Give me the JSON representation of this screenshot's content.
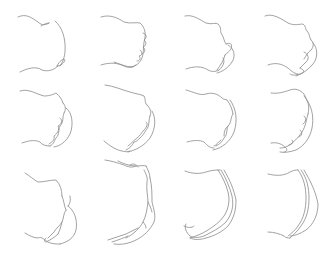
{
  "figure": {
    "width": 333,
    "height": 254,
    "background": "#ffffff",
    "stroke_color": "#8a8a8a",
    "stroke_width": 0.8,
    "layout": {
      "rows": 3,
      "cols": 4
    }
  },
  "panels": [
    {
      "id": "r1c1",
      "paths": [
        "M18,17 C26,13 32,18 38,22 C42,26 46,25 49,23",
        "M41,26 C44,24 47,23 49,23",
        "M55,21 C62,27 66,38 65,52 C64,60 62,63 60,66",
        "M20,72 C28,68 36,66 42,70 C48,72 54,70 58,66",
        "M57,66 C60,60 64,58 65,60 C64,63 61,66 57,66"
      ]
    },
    {
      "id": "r1c2",
      "paths": [
        "M101,17 C110,14 118,18 124,22 C130,24 136,22 140,23 C146,28 146,36 144,42 C143,48 144,55 141,60 C139,64 135,66 132,67",
        "M143,33 C147,34 147,38 144,40 C147,42 146,46 143,47 C146,49 145,53 142,54",
        "M140,50 C143,52 142,56 139,56 C141,58 140,61 137,61",
        "M101,65 C110,62 118,63 124,66 C128,68 132,68 136,65",
        "M114,62 C120,64 126,67 132,67"
      ]
    },
    {
      "id": "r1c3",
      "paths": [
        "M185,16 C193,14 200,20 206,23 C212,25 216,22 218,24 C222,28 220,31 221,33 C224,37 224,42 226,44",
        "M226,44 C230,42 233,44 231,49 C229,52 227,53 225,55",
        "M228,45 C234,48 236,56 232,62 C228,68 222,72 217,73",
        "M225,55 C224,60 220,66 217,70",
        "M223,58 C226,62 222,68 218,71",
        "M186,69 C194,66 202,66 208,70 C212,72 216,72 218,70"
      ]
    },
    {
      "id": "r1c4",
      "paths": [
        "M265,16 C272,13 280,18 288,23 C294,26 300,24 303,24 C306,26 305,29 307,31 C310,34 309,37 311,40",
        "M311,40 C314,42 314,47 311,50 C308,52 306,56 304,59",
        "M313,43 C318,48 318,58 313,64 C308,70 302,74 296,76",
        "M304,52 C308,54 310,58 306,62 C304,64 302,66 300,68",
        "M300,68 C304,70 306,72 300,74 C296,75 292,76 290,74",
        "M268,65 C276,62 282,64 288,68 C292,72 296,74 298,74"
      ]
    },
    {
      "id": "r2c1",
      "paths": [
        "M20,91 C28,88 36,94 44,96 C50,96 54,94 56,93 C60,96 62,100 63,103",
        "M63,103 C66,106 66,110 64,113",
        "M66,108 C72,112 74,124 70,134 C66,142 60,146 54,147",
        "M64,113 C62,118 64,122 60,126 C58,130 60,134 56,138 C54,141 54,144 50,146",
        "M60,118 C63,120 62,124 58,126 C60,130 57,134 54,136 C55,140 52,142 49,144",
        "M22,143 C30,140 36,140 40,142 C42,145 46,146 50,146"
      ]
    },
    {
      "id": "r2c2",
      "paths": [
        "M105,85 C114,86 122,90 130,92 C136,94 140,94 144,96 C146,99 144,102 147,105",
        "M147,105 C150,108 152,112 150,116",
        "M152,111 C156,118 156,128 150,138 C144,146 136,150 128,152",
        "M150,116 C148,122 150,126 146,130 C144,134 142,136 140,138 C138,140 136,142 134,142 C132,146 130,148 126,150",
        "M146,122 C149,124 146,128 144,130 C141,133 140,136 137,138 C134,140 132,143 128,146",
        "M104,141 C110,146 116,150 122,151 C126,152 128,152 130,151",
        "M105,160 C112,161 118,163 124,165 C128,167 132,168 136,166",
        "M130,165 C133,163 136,164 138,167"
      ]
    },
    {
      "id": "r2c3",
      "paths": [
        "M186,90 C194,92 200,96 206,94 C212,92 218,94 222,98 C224,100 226,99 227,100",
        "M227,100 C230,104 232,108 233,114",
        "M230,100 C236,108 238,120 234,132 C230,142 222,148 213,150",
        "M233,114 C230,118 232,122 228,126 C226,130 228,134 224,138 C222,142 220,144 216,146",
        "M228,126 C225,128 224,132 224,136",
        "M221,140 C218,142 217,145 214,146",
        "M187,142 C194,140 200,140 204,142 C208,146 210,148 214,148"
      ]
    },
    {
      "id": "r2c4",
      "paths": [
        "M271,93 C278,94 284,92 290,90 C296,88 300,90 304,94 C306,97 306,100 308,102",
        "M308,102 C312,108 314,118 312,128 C310,138 304,146 296,150 C290,152 284,153 280,152",
        "M304,96 C308,100 310,106 308,114",
        "M308,114 C306,120 306,126 302,132 C298,138 294,142 288,146 C284,148 282,148 280,148",
        "M304,116 C307,118 306,122 303,124",
        "M300,130 C303,132 302,136 299,137",
        "M292,140 C294,142 292,145 289,145",
        "M271,143 C278,142 282,144 286,148 C288,150 286,152 284,152"
      ]
    },
    {
      "id": "r3c1",
      "paths": [
        "M25,173 C30,176 34,180 38,182 C44,182 50,180 56,180 C60,184 62,190 62,196",
        "M62,196 C64,200 64,206 66,210",
        "M70,196 C71,200 70,204 68,206",
        "M68,206 C74,210 78,220 76,230 C74,238 68,242 60,244",
        "M66,210 C63,214 64,218 62,222 C61,226 60,230 58,234",
        "M62,222 C60,226 56,228 54,232 C52,234 50,236 48,238",
        "M58,234 C54,238 50,240 46,242 C44,242 44,240 46,238",
        "M25,233 C30,236 34,238 38,238 C42,236 44,240 48,242 C52,244 56,244 60,244"
      ]
    },
    {
      "id": "r3c2",
      "paths": [
        "M118,161 C124,164 130,166 136,166 C140,166 144,165 146,166",
        "M146,166 C148,170 150,174 150,178",
        "M144,170 C146,174 148,178 147,182 C146,190 148,196 148,202 C147,210 146,216 143,222 C140,228 134,234 126,238",
        "M150,178 C152,186 152,194 152,202 C154,210 156,216 154,222 C150,230 144,236 136,240 C128,244 120,245 114,244",
        "M148,202 C150,206 151,208 152,212",
        "M143,222 C145,224 146,226 146,228",
        "M108,240 C114,238 120,236 126,234 C130,232 134,230 138,228",
        "M112,242 C118,240 124,238 128,236"
      ]
    },
    {
      "id": "r3c3",
      "paths": [
        "M185,171 C192,174 200,174 206,172 C212,170 216,170 220,170",
        "M218,170 C222,176 226,184 228,192 C230,200 229,208 224,216 C220,222 214,226 208,230 C202,234 196,236 190,238",
        "M221,170 C226,178 230,188 232,196 C234,206 232,214 226,222 C220,228 212,232 204,236 C198,238 192,238 190,236",
        "M224,170 C230,180 234,190 236,200 C236,210 234,218 228,226 C222,232 214,236 206,238 C200,240 194,240 190,238",
        "M186,224 C184,228 186,232 190,236",
        "M184,226 C188,228 192,228 194,226"
      ]
    },
    {
      "id": "r3c4",
      "paths": [
        "M268,174 C276,176 284,176 290,172 C294,170 296,170 298,170",
        "M298,170 C304,178 306,188 306,198 C306,208 304,218 298,226 C294,232 290,234 288,236",
        "M301,170 C307,178 309,188 309,198 C309,208 307,218 301,226 C297,232 292,236 290,238",
        "M304,170 C310,180 316,192 318,204 C318,214 314,224 306,230 C300,234 294,236 290,236",
        "M268,232 C274,232 280,234 284,236 C286,238 288,238 290,238"
      ]
    }
  ]
}
